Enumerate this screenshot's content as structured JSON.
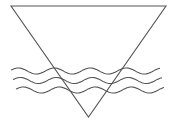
{
  "diagram": {
    "stroke_color": "#555555",
    "background_color": "#ffffff",
    "elements": [
      {
        "id": "triangle",
        "kind": "inverted-triangle"
      },
      {
        "id": "wave-1",
        "kind": "wave"
      },
      {
        "id": "wave-2",
        "kind": "wave"
      },
      {
        "id": "wave-3",
        "kind": "wave"
      }
    ]
  }
}
